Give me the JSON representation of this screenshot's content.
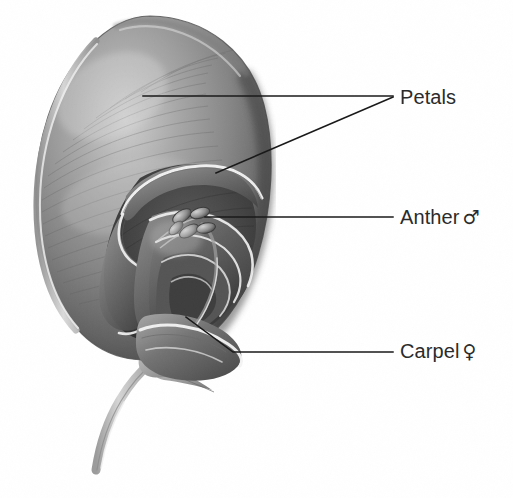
{
  "figure": {
    "background_color": "#ffffff",
    "line_color": "#1a1a1a",
    "text_color": "#2b2b2b",
    "width": 513,
    "height": 498
  },
  "labels": {
    "petals": {
      "text": "Petals",
      "symbol": "",
      "x": 400,
      "y": 97
    },
    "anther": {
      "text": "Anther",
      "symbol": "♂",
      "x": 400,
      "y": 217
    },
    "carpel": {
      "text": "Carpel",
      "symbol": "♀",
      "x": 400,
      "y": 352
    }
  },
  "leaders": {
    "petals_upper": {
      "from_x": 143,
      "from_y": 96,
      "to_x": 393,
      "to_y": 96
    },
    "petals_lower": {
      "from_x": 216,
      "from_y": 173,
      "to_x": 393,
      "to_y": 97
    },
    "anther": {
      "from_x": 205,
      "from_y": 217,
      "to_x": 393,
      "to_y": 217
    },
    "carpel_diag": {
      "from_x": 186,
      "from_y": 317,
      "to_x": 233,
      "to_y": 352
    },
    "carpel_flat": {
      "from_x": 233,
      "from_y": 352,
      "to_x": 393,
      "to_y": 352
    }
  },
  "structures": {
    "standard_petal": "standard-petal",
    "wing_petal": "wing-petal",
    "keel_petal": "keel-petal",
    "anther_lobes": "anther-lobes",
    "carpel_ovary": "carpel-ovary",
    "sepals": "sepals",
    "pedicel": "flower-stem"
  },
  "palette": {
    "petal_mid": "#8d8d8d",
    "petal_dark": "#4a4a4a",
    "petal_darkest": "#2f2f2f",
    "petal_light": "#c9c9c9",
    "highlight": "#f2f2f2",
    "stem_gray": "#b4b4b4"
  }
}
